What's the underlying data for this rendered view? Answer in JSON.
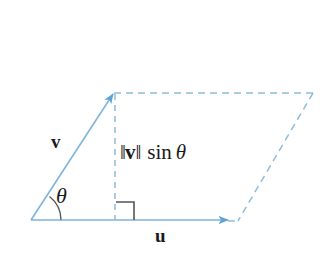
{
  "figure": {
    "background_color": "#ffffff",
    "stroke_color": "#7fb4dd",
    "dashed_color": "#8fbde0",
    "text_color": "#1a1a1a",
    "right_angle_color": "#555555",
    "labels": {
      "vector_v": "v",
      "vector_u": "u",
      "angle": "θ",
      "height_norm_open": "‖",
      "height_vector": "v",
      "height_norm_close": "‖",
      "height_function": "sin",
      "height_angle": "θ"
    },
    "geometry": {
      "origin": [
        31,
        220
      ],
      "v_tip": [
        113,
        93
      ],
      "u_tip": [
        230,
        220
      ],
      "parallelogram_top_right": [
        313,
        93
      ],
      "foot_of_height": [
        115,
        220
      ],
      "angle_arc_radius": 30,
      "right_angle_size": 18
    }
  }
}
